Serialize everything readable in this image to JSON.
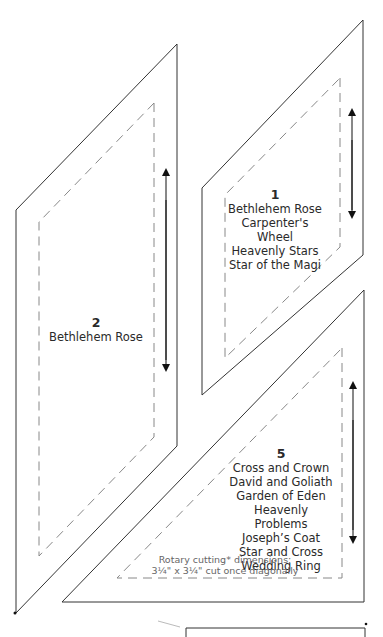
{
  "pieces": [
    {
      "id": "1",
      "number": "1",
      "names": [
        "Bethlehem Rose",
        "Carpenter's Wheel",
        "Heavenly Stars",
        "Star of the Magi"
      ]
    },
    {
      "id": "2",
      "number": "2",
      "names": [
        "Bethlehem Rose"
      ]
    },
    {
      "id": "5",
      "number": "5",
      "names": [
        "Cross and Crown",
        "David and Goliath",
        "Garden of Eden",
        "Heavenly Problems",
        "Joseph’s Coat",
        "Star and Cross",
        "Wedding Ring"
      ],
      "note_line1": "Rotary cutting* dimensions:",
      "note_line2": "3¼\" x 3¼\" cut once diagonally"
    }
  ],
  "colors": {
    "outline": "#333333",
    "seam": "#888888",
    "text": "#2a2a2a"
  }
}
